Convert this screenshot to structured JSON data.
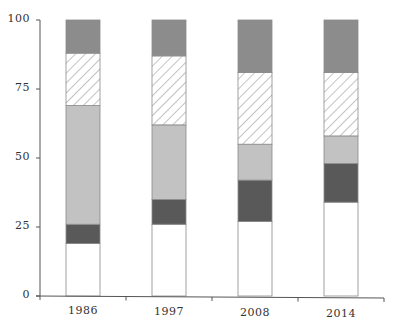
{
  "chart_data": {
    "type": "bar",
    "stacked": true,
    "title": "",
    "xlabel": "",
    "ylabel": "",
    "ylim": [
      0,
      100
    ],
    "yticks": [
      0,
      25,
      50,
      75,
      100
    ],
    "ytick_labels": [
      "0",
      "25",
      "50",
      "75",
      "100"
    ],
    "categories": [
      "1986",
      "1997",
      "2008",
      "2014"
    ],
    "grid": false,
    "legend": null,
    "series": [
      {
        "name": "segment-1 (white)",
        "fill": "#ffffff",
        "pattern": "solid",
        "values": [
          19,
          26,
          27,
          34
        ]
      },
      {
        "name": "segment-2 (dark gray)",
        "fill": "#595959",
        "pattern": "solid",
        "values": [
          7,
          9,
          15,
          14
        ]
      },
      {
        "name": "segment-3 (light gray)",
        "fill": "#c2c2c2",
        "pattern": "solid",
        "values": [
          43,
          27,
          13,
          10
        ]
      },
      {
        "name": "segment-4 (hatched)",
        "fill": "#ffffff",
        "pattern": "diagonal-hatch",
        "values": [
          19,
          25,
          26,
          23
        ]
      },
      {
        "name": "segment-5 (medium gray)",
        "fill": "#8c8c8c",
        "pattern": "solid",
        "values": [
          12,
          13,
          19,
          19
        ]
      }
    ]
  },
  "colors": {
    "axis": "#555555",
    "bar_outline": "#8a8a8a",
    "hatch_line": "#9a9a9a"
  }
}
